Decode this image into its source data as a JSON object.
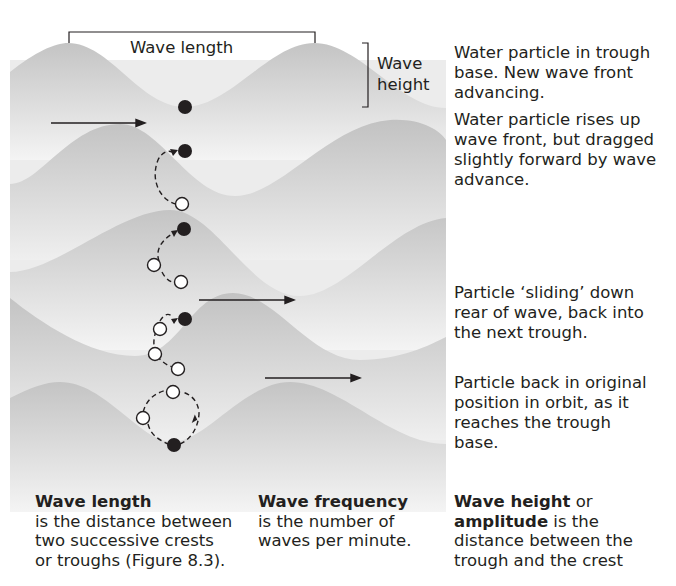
{
  "diagram": {
    "labels": {
      "wave_length": "Wave length",
      "wave_height_line1": "Wave",
      "wave_height_line2": "height"
    },
    "annotations": [
      {
        "id": "stage-1",
        "text": "Water particle in trough base. New wave front advancing.",
        "lines": [
          "Water particle in trough",
          "base. New wave front",
          "advancing."
        ]
      },
      {
        "id": "stage-2",
        "text": "Water particle rises up wave front, but dragged slightly forward by wave advance.",
        "lines": [
          "Water particle rises up",
          "wave front, but dragged",
          "slightly forward by wave",
          "advance."
        ]
      },
      {
        "id": "stage-3",
        "text": "Particle ‘sliding’ down rear of wave, back into the next trough.",
        "lines": [
          "Particle ‘sliding’ down",
          "rear of wave, back into",
          "the next trough."
        ]
      },
      {
        "id": "stage-4",
        "text": "Particle back in original position in orbit, as it reaches the trough base.",
        "lines": [
          "Particle back in original",
          "position in orbit, as it",
          "reaches the trough",
          "base."
        ]
      }
    ],
    "definitions": [
      {
        "term": "Wave length",
        "lines": [
          "is the distance between",
          "two successive crests",
          "or troughs (Figure 8.3)."
        ]
      },
      {
        "term": "Wave frequency",
        "lines": [
          "is the number of",
          "waves per minute."
        ]
      },
      {
        "term": "Wave height",
        "connector": " or",
        "term2": "amplitude",
        "rest_first": " is the",
        "lines": [
          "distance between the",
          "trough and the crest"
        ]
      }
    ],
    "colors": {
      "wave_fill": "#c8c8c8",
      "wave_light": "#eeeeee",
      "ink": "#231f20",
      "particle_filled": "#231f20",
      "particle_open": "#ffffff"
    }
  }
}
